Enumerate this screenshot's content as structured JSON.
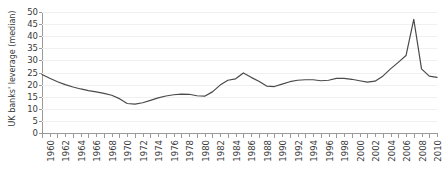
{
  "chart_data": {
    "type": "line",
    "title": "",
    "xlabel": "",
    "ylabel": "UK banks' leverage (median)",
    "ylim": [
      0,
      50
    ],
    "xlim": [
      1960,
      2011
    ],
    "grid": true,
    "legend": false,
    "yticks": [
      0,
      5,
      10,
      15,
      20,
      25,
      30,
      35,
      40,
      45,
      50
    ],
    "xticks": [
      1960,
      1962,
      1964,
      1966,
      1968,
      1970,
      1972,
      1974,
      1976,
      1978,
      1980,
      1982,
      1984,
      1986,
      1988,
      1990,
      1992,
      1994,
      1996,
      1998,
      2000,
      2002,
      2004,
      2006,
      2008,
      2010
    ],
    "x_minor_every": 1,
    "line_color": "#4a4a4a",
    "grid_color": "#f0f0f0",
    "axis_color": "#9a9a9a",
    "series": [
      {
        "name": "UK banks' leverage (median)",
        "x": [
          1960,
          1961,
          1962,
          1963,
          1964,
          1965,
          1966,
          1967,
          1968,
          1969,
          1970,
          1971,
          1972,
          1973,
          1974,
          1975,
          1976,
          1977,
          1978,
          1979,
          1980,
          1981,
          1982,
          1983,
          1984,
          1985,
          1986,
          1987,
          1988,
          1989,
          1990,
          1991,
          1992,
          1993,
          1994,
          1995,
          1996,
          1997,
          1998,
          1999,
          2000,
          2001,
          2002,
          2003,
          2004,
          2005,
          2006,
          2007,
          2008,
          2009,
          2010,
          2011
        ],
        "values": [
          24.2,
          22.6,
          21.2,
          20.0,
          19.0,
          18.2,
          17.5,
          17.0,
          16.4,
          15.6,
          14.2,
          12.2,
          11.9,
          12.5,
          13.5,
          14.5,
          15.3,
          15.8,
          16.1,
          16.0,
          15.4,
          15.2,
          17.0,
          19.8,
          21.8,
          22.4,
          24.8,
          23.0,
          21.4,
          19.4,
          19.2,
          20.2,
          21.2,
          21.8,
          22.0,
          22.0,
          21.6,
          21.8,
          22.6,
          22.6,
          22.2,
          21.6,
          21.0,
          21.4,
          23.5,
          26.5,
          29.2,
          32.0,
          47.0,
          26.5,
          23.5,
          23.0
        ]
      }
    ]
  }
}
